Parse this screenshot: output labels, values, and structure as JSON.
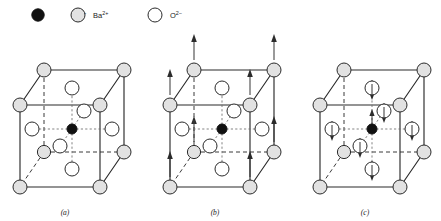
{
  "figure": {
    "type": "crystal-structure-diagram",
    "compound": "BaTiO3",
    "background_color": "#ffffff",
    "line_color": "#2b2b2b"
  },
  "legend": {
    "items": [
      {
        "symbol": "Ti",
        "charge": "4+",
        "label": "Ti",
        "superscript": "4+",
        "marker": "filled-circle",
        "fill_color": "#111111",
        "icon_name": "titanium-ion-marker"
      },
      {
        "symbol": "Ba",
        "charge": "2+",
        "label": "Ba",
        "superscript": "2+",
        "marker": "gray-circle",
        "fill_color": "#e2e2e2",
        "icon_name": "barium-ion-marker"
      },
      {
        "symbol": "O",
        "charge": "2-",
        "label": "O",
        "superscript": "2−",
        "marker": "open-circle",
        "fill_color": "#ffffff",
        "icon_name": "oxygen-ion-marker"
      }
    ]
  },
  "panels": [
    {
      "id": "a",
      "label": "(a)",
      "caption_label": "a",
      "arrows": "none",
      "description": "Cubic unit cell with Ba2+ at corners, Ti4+ at body center, O2- at face centers"
    },
    {
      "id": "b",
      "label": "(b)",
      "caption_label": "b",
      "arrows": "up-at-corners",
      "arrow_count": 8,
      "arrow_direction": "up",
      "description": "Same cell with upward arrows at the corner barium ions"
    },
    {
      "id": "c",
      "label": "(c)",
      "caption_label": "c",
      "arrows": "down-at-oxygen-up-at-titanium",
      "arrow_count": 7,
      "arrow_direction": "down",
      "center_arrow_direction": "up",
      "description": "Same cell with downward arrows through oxygen ions and an upward arrow at the titanium ion"
    }
  ],
  "geometry": {
    "atom_radius_ba": 7.0,
    "atom_radius_o": 7.0,
    "atom_radius_ti": 5.0,
    "cube_front_left_x": 20,
    "cube_front_top_y": 105,
    "cube_width": 80,
    "cube_height": 82,
    "depth_dx": 24,
    "depth_dy": -35
  }
}
